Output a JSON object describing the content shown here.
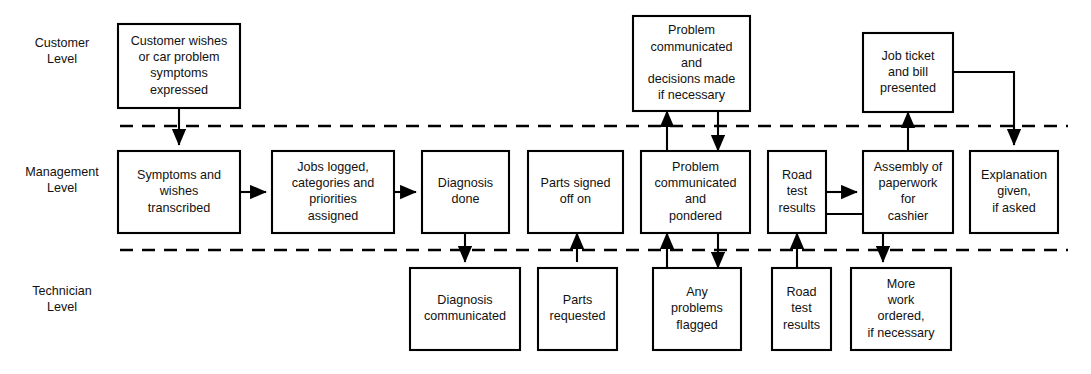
{
  "diagram": {
    "canvas": {
      "width": 1091,
      "height": 374
    },
    "lanes": [
      {
        "id": "customer",
        "line1": "Customer",
        "line2": "Level",
        "label_x": 62,
        "label_y": 47
      },
      {
        "id": "management",
        "line1": "Management",
        "line2": "Level",
        "label_x": 62,
        "label_y": 176
      },
      {
        "id": "technician",
        "line1": "Technician",
        "line2": "Level",
        "label_x": 62,
        "label_y": 295
      }
    ],
    "dividers": [
      {
        "id": "customer-management-divider",
        "x1": 120,
        "x2": 1068,
        "y": 126
      },
      {
        "id": "management-technician-divider",
        "x1": 120,
        "x2": 1068,
        "y": 250
      }
    ],
    "nodes": [
      {
        "id": "customer-wishes",
        "lane": "customer",
        "x": 118,
        "y": 24,
        "w": 122,
        "h": 84,
        "lines": [
          "Customer wishes",
          "or car problem",
          "symptoms",
          "expressed"
        ]
      },
      {
        "id": "problem-communicated-decisions",
        "lane": "customer",
        "x": 633,
        "y": 16,
        "w": 117,
        "h": 95,
        "lines": [
          "Problem",
          "communicated",
          "and",
          "decisions made",
          "if necessary"
        ]
      },
      {
        "id": "job-ticket-bill",
        "lane": "customer",
        "x": 863,
        "y": 33,
        "w": 90,
        "h": 79,
        "lines": [
          "Job ticket",
          "and bill",
          "presented"
        ]
      },
      {
        "id": "symptoms-transcribed",
        "lane": "management",
        "x": 118,
        "y": 151,
        "w": 122,
        "h": 82,
        "lines": [
          "Symptoms and",
          "wishes",
          "transcribed"
        ]
      },
      {
        "id": "jobs-logged",
        "lane": "management",
        "x": 272,
        "y": 151,
        "w": 122,
        "h": 82,
        "lines": [
          "Jobs logged,",
          "categories and",
          "priorities",
          "assigned"
        ]
      },
      {
        "id": "diagnosis-done",
        "lane": "management",
        "x": 422,
        "y": 151,
        "w": 87,
        "h": 82,
        "lines": [
          "Diagnosis",
          "done"
        ]
      },
      {
        "id": "parts-signed-off",
        "lane": "management",
        "x": 528,
        "y": 151,
        "w": 95,
        "h": 82,
        "lines": [
          "Parts signed",
          "off on"
        ]
      },
      {
        "id": "problem-communicated-pondered",
        "lane": "management",
        "x": 641,
        "y": 151,
        "w": 109,
        "h": 82,
        "lines": [
          "Problem",
          "communicated",
          "and",
          "pondered"
        ]
      },
      {
        "id": "road-test-results-mgmt",
        "lane": "management",
        "x": 768,
        "y": 151,
        "w": 58,
        "h": 82,
        "lines": [
          "Road",
          "test",
          "results"
        ]
      },
      {
        "id": "assembly-paperwork",
        "lane": "management",
        "x": 863,
        "y": 151,
        "w": 90,
        "h": 82,
        "lines": [
          "Assembly of",
          "paperwork",
          "for",
          "cashier"
        ]
      },
      {
        "id": "explanation-given",
        "lane": "management",
        "x": 970,
        "y": 151,
        "w": 88,
        "h": 82,
        "lines": [
          "Explanation",
          "given,",
          "if asked"
        ]
      },
      {
        "id": "diagnosis-communicated",
        "lane": "technician",
        "x": 410,
        "y": 268,
        "w": 110,
        "h": 82,
        "lines": [
          "Diagnosis",
          "communicated"
        ]
      },
      {
        "id": "parts-requested",
        "lane": "technician",
        "x": 538,
        "y": 268,
        "w": 79,
        "h": 82,
        "lines": [
          "Parts",
          "requested"
        ]
      },
      {
        "id": "any-problems-flagged",
        "lane": "technician",
        "x": 653,
        "y": 268,
        "w": 88,
        "h": 82,
        "lines": [
          "Any",
          "problems",
          "flagged"
        ]
      },
      {
        "id": "road-test-results-tech",
        "lane": "technician",
        "x": 772,
        "y": 268,
        "w": 59,
        "h": 82,
        "lines": [
          "Road",
          "test",
          "results"
        ]
      },
      {
        "id": "more-work-ordered",
        "lane": "technician",
        "x": 851,
        "y": 268,
        "w": 100,
        "h": 82,
        "lines": [
          "More",
          "work",
          "ordered,",
          "if necessary"
        ]
      }
    ],
    "connectors": [
      {
        "id": "customer-wishes-to-symptoms",
        "path": "M 179 108 L 179 145",
        "arrow": "end"
      },
      {
        "id": "symptoms-to-jobs-logged",
        "path": "M 240 192 L 266 192",
        "arrow": "end"
      },
      {
        "id": "jobs-logged-to-diagnosis",
        "path": "M 394 192 L 416 192",
        "arrow": "end"
      },
      {
        "id": "diagnosis-to-diagnosis-communicated",
        "path": "M 465 233 L 465 262",
        "arrow": "end"
      },
      {
        "id": "parts-requested-to-parts-signed",
        "path": "M 577 262 L 577 233",
        "arrow": "end"
      },
      {
        "id": "problem-pondered-up-to-customer",
        "path": "M 667 151 L 667 111",
        "arrow": "end"
      },
      {
        "id": "customer-decisions-down-to-pondered",
        "path": "M 718 111 L 718 151",
        "arrow": "end"
      },
      {
        "id": "flagged-up-to-problem-pondered",
        "path": "M 667 268 L 667 233",
        "arrow": "end"
      },
      {
        "id": "problem-pondered-down-to-flagged",
        "path": "M 718 233 L 718 268",
        "arrow": "end"
      },
      {
        "id": "tech-roadtest-up-to-mgmt-roadtest",
        "path": "M 797 268 L 797 233",
        "arrow": "end"
      },
      {
        "id": "mgmt-roadtest-to-assembly",
        "path": "M 826 192 L 857 192",
        "arrow": "end"
      },
      {
        "id": "mgmt-roadtest-to-more-work",
        "path": "M 826 214 L 883 214 L 883 262",
        "arrow": "end"
      },
      {
        "id": "assembly-up-to-job-ticket",
        "path": "M 908 151 L 908 112",
        "arrow": "end"
      },
      {
        "id": "job-ticket-to-explanation",
        "path": "M 953 72 L 1014 72 L 1014 145",
        "arrow": "end"
      }
    ]
  }
}
